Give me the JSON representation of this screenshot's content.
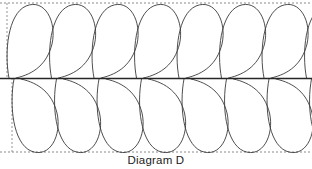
{
  "figure": {
    "caption": "Diagram D",
    "title": "Diagram D",
    "type": "quilting-feather-plume-pattern",
    "colors": {
      "background": "#ffffff",
      "stroke": "#3a3a3a",
      "spine": "#262626",
      "guide_dashed": "#7d7d7d",
      "caption_text": "#1b1b1b"
    },
    "geometry": {
      "width": 312,
      "height": 169,
      "top_guide_y": 3,
      "spine_y": 78,
      "bottom_guide_y": 152,
      "left_guide_x_top": 7,
      "left_guide_x_bottom": 12,
      "plume_spacing": 42.5,
      "plume_count_top": 7,
      "plume_count_bottom": 7,
      "stroke_width": 0.9,
      "spine_stroke_width": 1.3,
      "dash_pattern": "2,2"
    },
    "elements": {
      "top_guide_label": "top guide line",
      "bottom_guide_label": "bottom guide line",
      "spine_label": "center spine",
      "left_guide_top_label": "left start guide upper",
      "left_guide_bottom_label": "left start guide lower",
      "upper_plumes_label": "upper plume row",
      "lower_plumes_label": "lower plume row"
    }
  }
}
